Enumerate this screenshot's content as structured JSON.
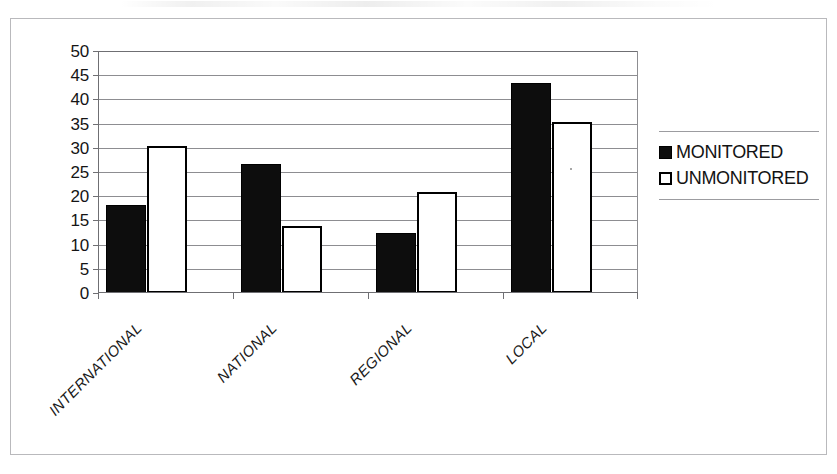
{
  "figure": {
    "background_color": "#ffffff",
    "frame_color": "#b9b9bc"
  },
  "chart_data": {
    "type": "bar",
    "title": "",
    "subtitle": "",
    "xlabel": "",
    "ylabel": "",
    "categories": [
      "INTERNATIONAL",
      "NATIONAL",
      "REGIONAL",
      "LOCAL"
    ],
    "series": [
      {
        "name": "MONITORED",
        "color": "#0d0d0d",
        "fill": "solid-black",
        "values": [
          18.2,
          26.7,
          12.3,
          43.4
        ]
      },
      {
        "name": "UNMONITORED",
        "color": "#ffffff",
        "fill": "white-with-black-outline",
        "values": [
          30.3,
          13.9,
          20.8,
          35.3
        ]
      }
    ],
    "ylim": [
      0,
      50
    ],
    "ytick_step": 5,
    "yticks": [
      0,
      5,
      10,
      15,
      20,
      25,
      30,
      35,
      40,
      45,
      50
    ],
    "ytick_labels": [
      "0",
      "5",
      "10",
      "15",
      "20",
      "25",
      "30",
      "35",
      "40",
      "45",
      "50"
    ],
    "grid": true,
    "grid_axis": "y",
    "grid_color": "#8d8d91",
    "legend_position": "right",
    "xtick_label_rotation": -45,
    "xtick_label_style": "italic"
  },
  "legend": {
    "items": [
      {
        "label": "MONITORED",
        "swatch": "filled-square-icon",
        "color": "#0d0d0d"
      },
      {
        "label": "UNMONITORED",
        "swatch": "outlined-square-icon",
        "color": "#ffffff"
      }
    ]
  }
}
